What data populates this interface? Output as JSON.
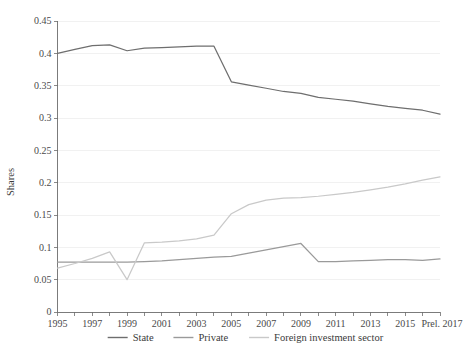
{
  "chart_data": {
    "type": "line",
    "title": "",
    "xlabel": "",
    "ylabel": "Shares",
    "ylim": [
      0,
      0.45
    ],
    "ytick_step": 0.05,
    "grid": true,
    "legend_position": "bottom",
    "x": [
      1995,
      1996,
      1997,
      1998,
      1999,
      2000,
      2001,
      2002,
      2003,
      2004,
      2005,
      2006,
      2007,
      2008,
      2009,
      2010,
      2011,
      2012,
      2013,
      2014,
      2015,
      2016,
      2017
    ],
    "x_tick_labels": [
      "1995",
      "1997",
      "1999",
      "2001",
      "2003",
      "2005",
      "2007",
      "2009",
      "2011",
      "2013",
      "2015",
      "Prel. 2017"
    ],
    "x_tick_values": [
      1995,
      1997,
      1999,
      2001,
      2003,
      2005,
      2007,
      2009,
      2011,
      2013,
      2015,
      2017
    ],
    "y_tick_labels": [
      "0",
      "0.05",
      "0.1",
      "0.15",
      "0.2",
      "0.25",
      "0.3",
      "0.35",
      "0.4",
      "0.45"
    ],
    "y_tick_values": [
      0,
      0.05,
      0.1,
      0.15,
      0.2,
      0.25,
      0.3,
      0.35,
      0.4,
      0.45
    ],
    "series": [
      {
        "name": "State",
        "color": "#6e6e6e",
        "values": [
          0.4,
          0.406,
          0.412,
          0.413,
          0.404,
          0.408,
          0.409,
          0.41,
          0.411,
          0.411,
          0.356,
          0.351,
          0.346,
          0.341,
          0.338,
          0.332,
          0.329,
          0.326,
          0.322,
          0.318,
          0.315,
          0.312,
          0.306
        ]
      },
      {
        "name": "Private",
        "color": "#9a9a9a",
        "values": [
          0.077,
          0.077,
          0.077,
          0.077,
          0.077,
          0.078,
          0.079,
          0.081,
          0.083,
          0.085,
          0.086,
          0.091,
          0.096,
          0.101,
          0.106,
          0.078,
          0.078,
          0.079,
          0.08,
          0.081,
          0.081,
          0.08,
          0.082
        ]
      },
      {
        "name": "Foreign investment sector",
        "color": "#c9c9c9",
        "values": [
          0.068,
          0.075,
          0.083,
          0.093,
          0.05,
          0.107,
          0.108,
          0.11,
          0.113,
          0.119,
          0.152,
          0.166,
          0.173,
          0.176,
          0.177,
          0.179,
          0.182,
          0.185,
          0.189,
          0.193,
          0.198,
          0.204,
          0.209
        ]
      }
    ]
  },
  "legend": {
    "items": [
      {
        "label": "State"
      },
      {
        "label": "Private"
      },
      {
        "label": "Foreign investment sector"
      }
    ]
  },
  "axes": {
    "y_title": "Shares"
  }
}
